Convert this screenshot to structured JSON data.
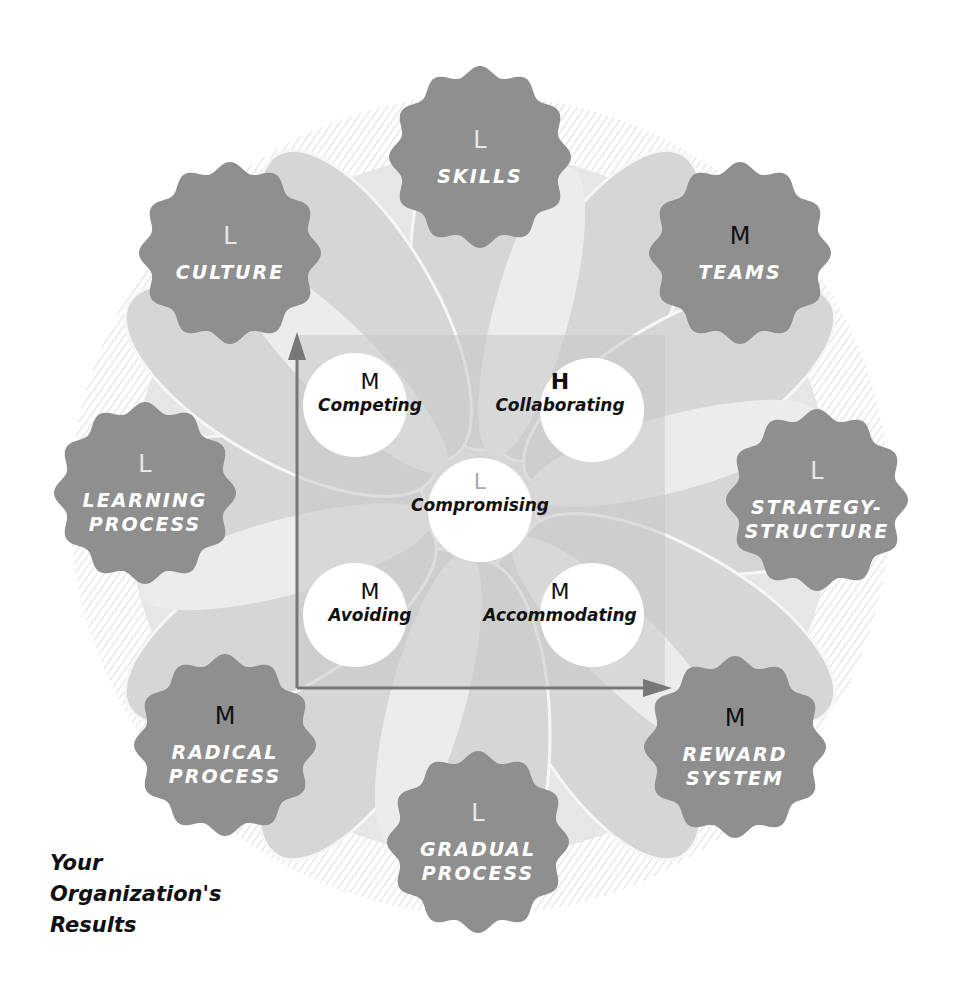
{
  "colors": {
    "badge_fill": "#8f8f8f",
    "petal_light": "#e4e4e4",
    "petal_mid": "#cfcfcf",
    "axis": "#777777",
    "circle_fill": "#ffffff",
    "label_text": "#ffffff"
  },
  "badges": [
    {
      "label_lines": [
        "SKILLS"
      ],
      "level": "L"
    },
    {
      "label_lines": [
        "TEAMS"
      ],
      "level": "M"
    },
    {
      "label_lines": [
        "STRATEGY-",
        "STRUCTURE"
      ],
      "level": "L"
    },
    {
      "label_lines": [
        "REWARD",
        "SYSTEM"
      ],
      "level": "M"
    },
    {
      "label_lines": [
        "GRADUAL",
        "PROCESS"
      ],
      "level": "L"
    },
    {
      "label_lines": [
        "RADICAL",
        "PROCESS"
      ],
      "level": "M"
    },
    {
      "label_lines": [
        "LEARNING",
        "PROCESS"
      ],
      "level": "L"
    },
    {
      "label_lines": [
        "CULTURE"
      ],
      "level": "L"
    }
  ],
  "conflict_modes": [
    {
      "name": "Competing",
      "level": "M"
    },
    {
      "name": "Collaborating",
      "level": "H"
    },
    {
      "name": "Compromising",
      "level": "L"
    },
    {
      "name": "Avoiding",
      "level": "M"
    },
    {
      "name": "Accommodating",
      "level": "M"
    }
  ],
  "axes": {
    "vertical_arrow": "arrow-up",
    "horizontal_arrow": "arrow-right"
  },
  "caption": {
    "lines": [
      "Your",
      "Organization's",
      "Results"
    ]
  }
}
